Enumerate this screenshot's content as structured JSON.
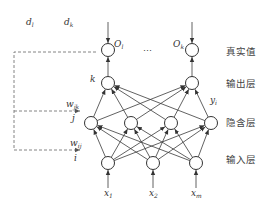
{
  "layers": {
    "target": {
      "label": "真实值",
      "nodes": [
        {
          "name": "O",
          "sub": "l",
          "x": 108,
          "y": 50
        },
        {
          "name": "O",
          "sub": "k",
          "x": 192,
          "y": 50
        }
      ],
      "ellipsis": "…"
    },
    "output": {
      "label": "输出层",
      "index_label": "k",
      "nodes": [
        {
          "x": 108,
          "y": 83
        },
        {
          "x": 192,
          "y": 83
        }
      ],
      "edge_label": {
        "name": "y",
        "sub": "i"
      }
    },
    "hidden": {
      "label": "隐含层",
      "index_label": "j",
      "nodes": [
        {
          "x": 91,
          "y": 123
        },
        {
          "x": 131,
          "y": 123
        },
        {
          "x": 171,
          "y": 123
        },
        {
          "x": 211,
          "y": 123
        }
      ]
    },
    "input": {
      "label": "输入层",
      "index_label": "i",
      "nodes": [
        {
          "x": 108,
          "y": 163
        },
        {
          "x": 153,
          "y": 163
        },
        {
          "x": 196,
          "y": 163
        }
      ]
    }
  },
  "inputs": [
    {
      "name": "x",
      "sub": "1"
    },
    {
      "name": "x",
      "sub": "2"
    },
    {
      "name": "x",
      "sub": "m"
    }
  ],
  "errors": [
    {
      "name": "d",
      "sub": "l"
    },
    {
      "name": "d",
      "sub": "k"
    }
  ],
  "weights": {
    "hidden_output": {
      "name": "w",
      "sub": "jk"
    },
    "input_hidden": {
      "name": "w",
      "sub": "ij"
    }
  },
  "colors": {
    "stroke": "#333333",
    "dashed": "#777777",
    "text": "#444444"
  }
}
